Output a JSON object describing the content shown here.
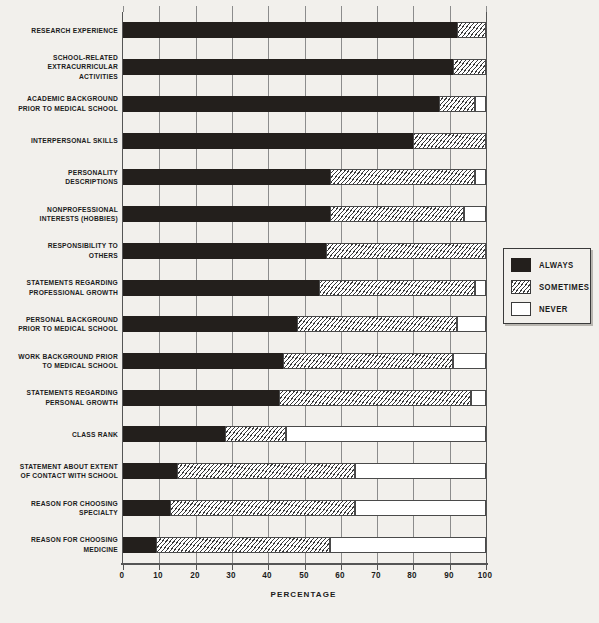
{
  "chart_data": {
    "type": "bar",
    "subtype": "stacked-horizontal-100pct",
    "title": "",
    "xlabel": "PERCENTAGE",
    "ylabel": "",
    "xlim": [
      0,
      100
    ],
    "xticks": [
      0,
      10,
      20,
      30,
      40,
      50,
      60,
      70,
      80,
      90,
      100
    ],
    "grid": true,
    "grid_axis": "x",
    "legend_position": "right",
    "categories": [
      "RESEARCH EXPERIENCE",
      "SCHOOL-RELATED\nEXTRACURRICULAR\nACTIVITIES",
      "ACADEMIC BACKGROUND\nPRIOR TO MEDICAL SCHOOL",
      "INTERPERSONAL SKILLS",
      "PERSONALITY\nDESCRIPTIONS",
      "NONPROFESSIONAL\nINTERESTS (HOBBIES)",
      "RESPONSIBILITY TO\nOTHERS",
      "STATEMENTS REGARDING\nPROFESSIONAL GROWTH",
      "PERSONAL BACKGROUND\nPRIOR TO MEDICAL SCHOOL",
      "WORK BACKGROUND PRIOR\nTO MEDICAL SCHOOL",
      "STATEMENTS REGARDING\nPERSONAL GROWTH",
      "CLASS RANK",
      "STATEMENT ABOUT EXTENT\nOF CONTACT WITH SCHOOL",
      "REASON FOR CHOOSING\nSPECIALTY",
      "REASON FOR CHOOSING\nMEDICINE"
    ],
    "series": [
      {
        "name": "ALWAYS",
        "color": "#231f1c",
        "values": [
          92,
          91,
          87,
          80,
          57,
          57,
          56,
          54,
          48,
          44,
          43,
          28,
          15,
          13,
          9
        ]
      },
      {
        "name": "SOMETIMES",
        "color": "hatched",
        "values": [
          8,
          9,
          10,
          20,
          40,
          37,
          44,
          43,
          44,
          47,
          53,
          17,
          49,
          51,
          48
        ]
      },
      {
        "name": "NEVER",
        "color": "#ffffff",
        "values": [
          0,
          0,
          3,
          0,
          3,
          6,
          0,
          3,
          8,
          9,
          4,
          55,
          36,
          36,
          43
        ]
      }
    ]
  },
  "legend": {
    "items": [
      {
        "label": "ALWAYS",
        "swatch": "solid-black"
      },
      {
        "label": "SOMETIMES",
        "swatch": "hatched"
      },
      {
        "label": "NEVER",
        "swatch": "white"
      }
    ]
  },
  "axis": {
    "x_title": "PERCENTAGE",
    "tick_labels": [
      "0",
      "10",
      "20",
      "30",
      "40",
      "50",
      "60",
      "70",
      "80",
      "90",
      "100"
    ]
  },
  "colors": {
    "background": "#f2f0ec",
    "always": "#231f1c",
    "never": "#ffffff",
    "frame": "#555555",
    "grid": "#8c8c8c"
  }
}
